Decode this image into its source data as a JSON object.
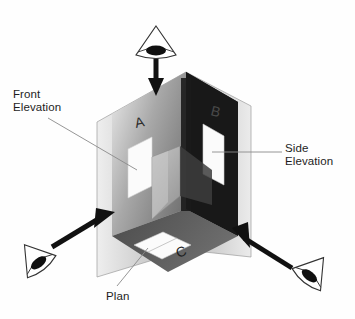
{
  "figure": {
    "background_color": "#fefefe"
  },
  "labels": {
    "front_elevation": "Front\nElevation",
    "side_elevation": "Side\nElevation",
    "plan": "Plan"
  },
  "face_letters": {
    "a": "A",
    "b": "B",
    "c": "C"
  },
  "colors": {
    "dark_face": "#1a1a1a",
    "mid_gray": "#8f8f8f",
    "light_gray": "#d9d9d9",
    "plane_tint": "#c9c9c9",
    "white_shape": "#fbfbfb",
    "arrow_black": "#111111",
    "leader_line": "#7a7a7a",
    "text": "#1d1d1d",
    "eye_outline": "#3a3a3a",
    "eye_pupil": "#101010"
  },
  "icons": {
    "eye_top": "eye-icon",
    "eye_bottom_left": "eye-icon",
    "eye_bottom_right": "eye-icon"
  },
  "arrows": {
    "top": "view-direction-arrow-down",
    "left": "view-direction-arrow-up-right",
    "right": "view-direction-arrow-up-left"
  }
}
